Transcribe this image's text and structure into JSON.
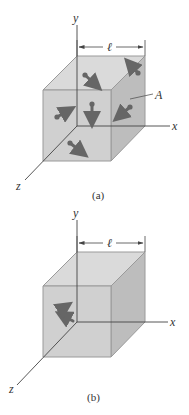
{
  "figures": [
    {
      "id": "a",
      "caption": "(a)",
      "axis_labels": {
        "x": "x",
        "y": "y",
        "z": "z"
      },
      "dimension_label": "ℓ",
      "point_label": "A",
      "geometry": {
        "origin": [
          77,
          126
        ],
        "edge_length": 68,
        "depth_offset": [
          -34,
          34
        ],
        "y_axis_top": 25,
        "x_axis_end": 170,
        "z_axis_end": [
          25,
          180
        ],
        "dimension_y": 47
      },
      "arrows": [
        {
          "tail": [
            85,
            75
          ],
          "head": [
            101,
            89
          ],
          "face": "top"
        },
        {
          "tail": [
            138,
            73
          ],
          "head": [
            126,
            60
          ],
          "face": "top-right"
        },
        {
          "tail": [
            57,
            117
          ],
          "head": [
            74,
            108
          ],
          "face": "front"
        },
        {
          "tail": [
            92,
            104
          ],
          "head": [
            92,
            127
          ],
          "face": "interior"
        },
        {
          "tail": [
            130,
            107
          ],
          "head": [
            115,
            120
          ],
          "face": "right"
        },
        {
          "tail": [
            70,
            143
          ],
          "head": [
            87,
            156
          ],
          "face": "front-bottom"
        }
      ],
      "leader": {
        "from": [
          130,
          99
        ],
        "to": [
          153,
          94
        ],
        "label_pos": [
          155,
          99
        ]
      }
    },
    {
      "id": "b",
      "caption": "(b)",
      "axis_labels": {
        "x": "x",
        "y": "y",
        "z": "z"
      },
      "dimension_label": "ℓ",
      "geometry": {
        "origin": [
          77,
          322
        ],
        "edge_length": 68,
        "depth_offset": [
          -34,
          34
        ],
        "y_axis_top": 220,
        "x_axis_end": 168,
        "z_axis_end": [
          17,
          385
        ],
        "dimension_y": 243
      },
      "arrows": [
        {
          "tail": [
            73,
            321
          ],
          "head": [
            57,
            313
          ],
          "face": "front"
        },
        {
          "tail": [
            59,
            311
          ],
          "head": [
            70,
            303
          ],
          "face": "front"
        }
      ]
    }
  ],
  "colors": {
    "top_face": "#dadada",
    "front_face": "#d0d0d0",
    "right_face": "#bdbdbd",
    "edge": "#9a9a9a",
    "axis": "#444444",
    "arrow": "#666666"
  }
}
